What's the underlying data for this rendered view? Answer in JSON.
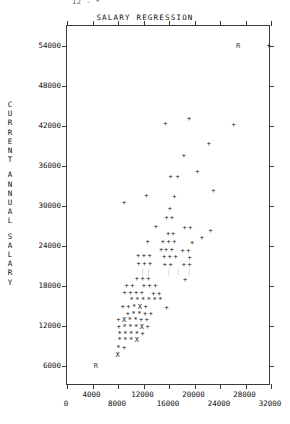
{
  "stray_top_text": "12 - *",
  "chart_data": {
    "type": "scatter",
    "title": "SALARY REGRESSION",
    "xlabel": "",
    "ylabel": "CURRENT ANNUAL SALARY",
    "ylabel_chars": [
      "C",
      "U",
      "R",
      "R",
      "E",
      "N",
      "T",
      "",
      "A",
      "N",
      "N",
      "U",
      "A",
      "L",
      "",
      "S",
      "A",
      "L",
      "A",
      "R",
      "Y"
    ],
    "xlim": [
      0,
      32000
    ],
    "ylim": [
      3000,
      57000
    ],
    "grid": false,
    "legend": null,
    "xticks": [
      0,
      4000,
      8000,
      12000,
      16000,
      20000,
      24000,
      28000,
      32000
    ],
    "xtick_labels_upper": [
      "4000",
      "12000",
      "20000",
      "28000"
    ],
    "xtick_labels_lower": [
      "0",
      "8000",
      "16000",
      "24000",
      "32000"
    ],
    "yticks": [
      6000,
      12000,
      18000,
      24000,
      30000,
      36000,
      42000,
      48000,
      54000
    ],
    "ytick_labels": [
      "6000",
      "12000",
      "18000",
      "24000",
      "30000",
      "36000",
      "42000",
      "48000",
      "54000"
    ],
    "marker_legend": {
      "plus": "+  = 1 observation",
      "star": "*  = 2 observations",
      "ex": "X  = 3 or more observations",
      "r": "R  = regression line"
    },
    "points": [
      {
        "x": 31800,
        "y": 53800,
        "m": "+"
      },
      {
        "x": 27000,
        "y": 53900,
        "m": "R"
      },
      {
        "x": 19300,
        "y": 42900,
        "m": "+"
      },
      {
        "x": 26300,
        "y": 42000,
        "m": "+"
      },
      {
        "x": 15600,
        "y": 42100,
        "m": "+"
      },
      {
        "x": 22400,
        "y": 39100,
        "m": "+"
      },
      {
        "x": 18500,
        "y": 37300,
        "m": "+"
      },
      {
        "x": 20600,
        "y": 35000,
        "m": "+"
      },
      {
        "x": 16400,
        "y": 34200,
        "m": "+"
      },
      {
        "x": 17500,
        "y": 34200,
        "m": "+"
      },
      {
        "x": 23100,
        "y": 32100,
        "m": "+"
      },
      {
        "x": 12600,
        "y": 31300,
        "m": "+"
      },
      {
        "x": 17000,
        "y": 31200,
        "m": "+"
      },
      {
        "x": 9100,
        "y": 30300,
        "m": "+"
      },
      {
        "x": 16300,
        "y": 29400,
        "m": "+"
      },
      {
        "x": 15800,
        "y": 28000,
        "m": "+"
      },
      {
        "x": 16600,
        "y": 28000,
        "m": "+"
      },
      {
        "x": 14100,
        "y": 26700,
        "m": "+"
      },
      {
        "x": 18600,
        "y": 26600,
        "m": "+"
      },
      {
        "x": 19500,
        "y": 26600,
        "m": "+"
      },
      {
        "x": 22700,
        "y": 26100,
        "m": "+"
      },
      {
        "x": 16000,
        "y": 25600,
        "m": "+"
      },
      {
        "x": 16800,
        "y": 25600,
        "m": "+"
      },
      {
        "x": 21300,
        "y": 25100,
        "m": "+"
      },
      {
        "x": 12800,
        "y": 24500,
        "m": "+"
      },
      {
        "x": 15200,
        "y": 24400,
        "m": "+"
      },
      {
        "x": 16100,
        "y": 24400,
        "m": "+"
      },
      {
        "x": 17000,
        "y": 24400,
        "m": "+"
      },
      {
        "x": 19800,
        "y": 24300,
        "m": "+"
      },
      {
        "x": 14900,
        "y": 23300,
        "m": "+"
      },
      {
        "x": 15700,
        "y": 23300,
        "m": "+"
      },
      {
        "x": 16600,
        "y": 23300,
        "m": "+"
      },
      {
        "x": 18300,
        "y": 23100,
        "m": "+"
      },
      {
        "x": 19200,
        "y": 23100,
        "m": "+"
      },
      {
        "x": 11300,
        "y": 22300,
        "m": "+"
      },
      {
        "x": 12200,
        "y": 22300,
        "m": "+"
      },
      {
        "x": 13100,
        "y": 22300,
        "m": "+"
      },
      {
        "x": 15400,
        "y": 22200,
        "m": "+"
      },
      {
        "x": 16300,
        "y": 22200,
        "m": "+"
      },
      {
        "x": 17200,
        "y": 22200,
        "m": "+"
      },
      {
        "x": 19400,
        "y": 22100,
        "m": "+"
      },
      {
        "x": 11400,
        "y": 21100,
        "m": "+"
      },
      {
        "x": 12300,
        "y": 21100,
        "m": "+"
      },
      {
        "x": 13200,
        "y": 21100,
        "m": "+"
      },
      {
        "x": 15500,
        "y": 21000,
        "m": "+"
      },
      {
        "x": 16400,
        "y": 21000,
        "m": "+"
      },
      {
        "x": 18500,
        "y": 21000,
        "m": "+"
      },
      {
        "x": 19400,
        "y": 21000,
        "m": "+"
      },
      {
        "x": 12000,
        "y": 20000,
        "m": "|"
      },
      {
        "x": 12900,
        "y": 20000,
        "m": "|"
      },
      {
        "x": 16100,
        "y": 19900,
        "m": "|"
      },
      {
        "x": 17600,
        "y": 19900,
        "m": "|"
      },
      {
        "x": 19300,
        "y": 19900,
        "m": "|"
      },
      {
        "x": 11100,
        "y": 18900,
        "m": "+"
      },
      {
        "x": 12000,
        "y": 18900,
        "m": "+"
      },
      {
        "x": 12900,
        "y": 18900,
        "m": "+"
      },
      {
        "x": 18700,
        "y": 18800,
        "m": "+"
      },
      {
        "x": 9500,
        "y": 17900,
        "m": "+"
      },
      {
        "x": 10400,
        "y": 17900,
        "m": "+"
      },
      {
        "x": 12200,
        "y": 17800,
        "m": "+"
      },
      {
        "x": 13100,
        "y": 17800,
        "m": "+"
      },
      {
        "x": 14000,
        "y": 17800,
        "m": "+"
      },
      {
        "x": 9200,
        "y": 16800,
        "m": "+"
      },
      {
        "x": 10100,
        "y": 16800,
        "m": "+"
      },
      {
        "x": 11000,
        "y": 16800,
        "m": "+"
      },
      {
        "x": 11900,
        "y": 16800,
        "m": "+"
      },
      {
        "x": 13700,
        "y": 16700,
        "m": "+"
      },
      {
        "x": 14600,
        "y": 16700,
        "m": "+"
      },
      {
        "x": 10300,
        "y": 15800,
        "m": "*"
      },
      {
        "x": 11200,
        "y": 15800,
        "m": "*"
      },
      {
        "x": 12100,
        "y": 15700,
        "m": "*"
      },
      {
        "x": 13000,
        "y": 15700,
        "m": "*"
      },
      {
        "x": 13900,
        "y": 15700,
        "m": "*"
      },
      {
        "x": 14800,
        "y": 15700,
        "m": "*"
      },
      {
        "x": 8900,
        "y": 14700,
        "m": "+"
      },
      {
        "x": 9800,
        "y": 14700,
        "m": "+"
      },
      {
        "x": 10700,
        "y": 14700,
        "m": "*"
      },
      {
        "x": 11600,
        "y": 14700,
        "m": "X"
      },
      {
        "x": 12500,
        "y": 14700,
        "m": "+"
      },
      {
        "x": 15800,
        "y": 14600,
        "m": "+"
      },
      {
        "x": 9700,
        "y": 13700,
        "m": "+"
      },
      {
        "x": 10600,
        "y": 13700,
        "m": "*"
      },
      {
        "x": 11500,
        "y": 13700,
        "m": "*"
      },
      {
        "x": 12400,
        "y": 13700,
        "m": "+"
      },
      {
        "x": 13300,
        "y": 13700,
        "m": "+"
      },
      {
        "x": 8200,
        "y": 12700,
        "m": "+"
      },
      {
        "x": 9100,
        "y": 12700,
        "m": "X"
      },
      {
        "x": 10000,
        "y": 12700,
        "m": "*"
      },
      {
        "x": 10900,
        "y": 12700,
        "m": "*"
      },
      {
        "x": 11800,
        "y": 12700,
        "m": "+"
      },
      {
        "x": 12700,
        "y": 12700,
        "m": "+"
      },
      {
        "x": 8300,
        "y": 11700,
        "m": "+"
      },
      {
        "x": 9200,
        "y": 11700,
        "m": "*"
      },
      {
        "x": 10100,
        "y": 11700,
        "m": "*"
      },
      {
        "x": 11000,
        "y": 11700,
        "m": "*"
      },
      {
        "x": 11900,
        "y": 11700,
        "m": "X"
      },
      {
        "x": 12800,
        "y": 11700,
        "m": "+"
      },
      {
        "x": 8400,
        "y": 10700,
        "m": "*"
      },
      {
        "x": 9300,
        "y": 10700,
        "m": "*"
      },
      {
        "x": 10200,
        "y": 10700,
        "m": "*"
      },
      {
        "x": 11100,
        "y": 10700,
        "m": "*"
      },
      {
        "x": 12000,
        "y": 10700,
        "m": "+"
      },
      {
        "x": 8400,
        "y": 9700,
        "m": "*"
      },
      {
        "x": 9300,
        "y": 9700,
        "m": "*"
      },
      {
        "x": 10200,
        "y": 9700,
        "m": "*"
      },
      {
        "x": 11100,
        "y": 9700,
        "m": "X"
      },
      {
        "x": 8200,
        "y": 8600,
        "m": "*"
      },
      {
        "x": 9100,
        "y": 8600,
        "m": "+"
      },
      {
        "x": 8100,
        "y": 7500,
        "m": "X"
      },
      {
        "x": 4700,
        "y": 5900,
        "m": "R"
      }
    ]
  }
}
